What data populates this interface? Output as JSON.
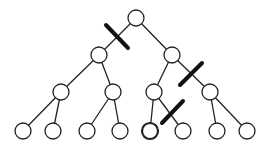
{
  "diagram": {
    "type": "binary-tree-with-cut-edges",
    "nodes": [
      {
        "id": "n0",
        "x": 136,
        "y": 18
      },
      {
        "id": "n1",
        "x": 99,
        "y": 55
      },
      {
        "id": "n2",
        "x": 172,
        "y": 55
      },
      {
        "id": "n3",
        "x": 61,
        "y": 92
      },
      {
        "id": "n4",
        "x": 113,
        "y": 92
      },
      {
        "id": "n5",
        "x": 154,
        "y": 92
      },
      {
        "id": "n6",
        "x": 210,
        "y": 92
      },
      {
        "id": "n7",
        "x": 23,
        "y": 131
      },
      {
        "id": "n8",
        "x": 53,
        "y": 131
      },
      {
        "id": "n9",
        "x": 87,
        "y": 131
      },
      {
        "id": "n10",
        "x": 120,
        "y": 131
      },
      {
        "id": "n11",
        "x": 150,
        "y": 131,
        "emphasized": true
      },
      {
        "id": "n12",
        "x": 183,
        "y": 131
      },
      {
        "id": "n13",
        "x": 217,
        "y": 131
      },
      {
        "id": "n14",
        "x": 247,
        "y": 131
      }
    ],
    "edges": [
      [
        "n0",
        "n1"
      ],
      [
        "n0",
        "n2"
      ],
      [
        "n1",
        "n3"
      ],
      [
        "n1",
        "n4"
      ],
      [
        "n2",
        "n5"
      ],
      [
        "n2",
        "n6"
      ],
      [
        "n3",
        "n7"
      ],
      [
        "n3",
        "n8"
      ],
      [
        "n4",
        "n9"
      ],
      [
        "n4",
        "n10"
      ],
      [
        "n5",
        "n11"
      ],
      [
        "n5",
        "n12"
      ],
      [
        "n6",
        "n13"
      ],
      [
        "n6",
        "n14"
      ]
    ],
    "cut_edges": [
      {
        "edge": [
          "n0",
          "n1"
        ],
        "x1": 106,
        "y1": 25,
        "x2": 128,
        "y2": 48
      },
      {
        "edge": [
          "n2",
          "n6"
        ],
        "x1": 180,
        "y1": 85,
        "x2": 202,
        "y2": 63
      },
      {
        "edge": [
          "n5",
          "n12"
        ],
        "x1": 162,
        "y1": 123,
        "x2": 183,
        "y2": 101
      }
    ],
    "node_radius": 8,
    "colors": {
      "stroke": "#222222",
      "fill": "#ffffff",
      "cut": "#111111"
    }
  }
}
